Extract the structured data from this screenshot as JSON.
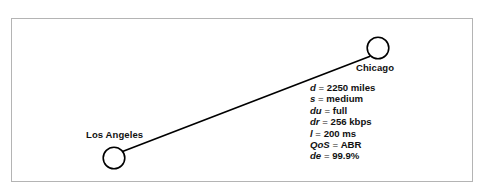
{
  "figure": {
    "type": "network-link-diagram",
    "frame": {
      "border_color": "#b4b4b4",
      "background": "#ffffff"
    },
    "line_color": "#000000",
    "text_color": "#111111"
  },
  "nodes": [
    {
      "id": "los-angeles",
      "label": "Los Angeles",
      "label_position": "above-right-of-circle"
    },
    {
      "id": "chicago",
      "label": "Chicago",
      "label_position": "below-left-of-circle"
    }
  ],
  "link": {
    "from": "los-angeles",
    "to": "chicago",
    "parameters": [
      {
        "symbol": "d",
        "equals": "=",
        "value": "2250 miles"
      },
      {
        "symbol": "s",
        "equals": "=",
        "value": "medium"
      },
      {
        "symbol": "du",
        "equals": "=",
        "value": "full"
      },
      {
        "symbol": "dr",
        "equals": "=",
        "value": "256 kbps"
      },
      {
        "symbol": "l",
        "equals": "=",
        "value": "200 ms"
      },
      {
        "symbol": "QoS",
        "equals": "=",
        "value": "ABR"
      },
      {
        "symbol": "de",
        "equals": "=",
        "value": "99.9%"
      }
    ]
  }
}
